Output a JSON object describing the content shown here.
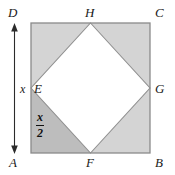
{
  "figure": {
    "background_color": "#ffffff"
  },
  "colors": {
    "outline": "#8a8a8a",
    "diamond_edge": "#8f8f8f",
    "corner_shade_light": "#d4d4d4",
    "corner_shade_dark": "#bdbdbd",
    "inner_fill": "#ffffff",
    "arrow": "#2b2b2b",
    "label_text": "#1a1a1a"
  },
  "outer_square": {
    "name": "ABCD",
    "corners": [
      {
        "id": "D",
        "label": "D",
        "position": "top-left"
      },
      {
        "id": "C",
        "label": "C",
        "position": "top-right"
      },
      {
        "id": "A",
        "label": "A",
        "position": "bottom-left"
      },
      {
        "id": "B",
        "label": "B",
        "position": "bottom-right"
      }
    ],
    "side_length_label": "x"
  },
  "inner_square": {
    "name": "EFGH",
    "vertices": [
      {
        "id": "H",
        "label": "H",
        "position": "top-midpoint"
      },
      {
        "id": "G",
        "label": "G",
        "position": "right-midpoint"
      },
      {
        "id": "F",
        "label": "F",
        "position": "bottom-midpoint"
      },
      {
        "id": "E",
        "label": "E",
        "position": "left-midpoint"
      }
    ],
    "fill": "white"
  },
  "dimensions": {
    "side": {
      "label": "x",
      "description": "full side length of square ABCD, marked by double arrow on left side"
    },
    "half_side": {
      "numerator": "x",
      "denominator": "2",
      "label": "x/2",
      "description": "half side length, marked inside lower-left triangle AEF"
    }
  },
  "regions": [
    {
      "id": "AEF",
      "shade": "dark",
      "description": "lower-left corner triangle"
    },
    {
      "id": "DEH",
      "shade": "light",
      "description": "upper-left corner triangle"
    },
    {
      "id": "HCG",
      "shade": "light",
      "description": "upper-right corner triangle"
    },
    {
      "id": "FGB",
      "shade": "light",
      "description": "lower-right corner triangle"
    }
  ],
  "annotations": {
    "arrow": {
      "type": "double-headed-vertical",
      "label": "x"
    }
  }
}
